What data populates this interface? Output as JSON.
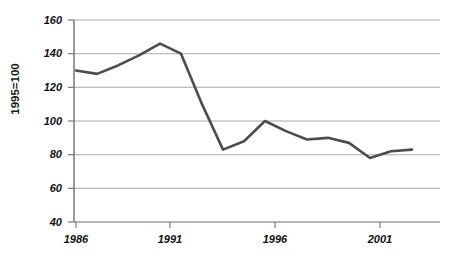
{
  "chart_data": {
    "type": "line",
    "title": "",
    "subtitle": "",
    "xlabel": "",
    "ylabel": "1995=100",
    "xlim": [
      1986,
      2002
    ],
    "ylim": [
      40,
      160
    ],
    "grid": true,
    "legend": false,
    "line_color": "#4d4d4d",
    "grid_color": "#a8a8a8",
    "axis_color": "#6e6e6e",
    "y_ticks": [
      160,
      140,
      120,
      100,
      80,
      60,
      40
    ],
    "x_ticks": [
      1986,
      1991,
      1996,
      2001
    ],
    "x_tick_labels": [
      "1986",
      "1991",
      "1996",
      "2001"
    ],
    "y_tick_labels": [
      "160",
      "140",
      "120",
      "100",
      "80",
      "60",
      "40"
    ],
    "x": [
      1986,
      1987,
      1988,
      1989,
      1990,
      1991,
      1992,
      1993,
      1994,
      1995,
      1996,
      1997,
      1998,
      1999,
      2000,
      2001,
      2002
    ],
    "series": [
      {
        "name": "Index (1995=100)",
        "values": [
          130,
          128,
          133,
          139,
          146,
          140,
          110,
          83,
          88,
          100,
          94,
          89,
          90,
          87,
          78,
          82,
          83
        ]
      }
    ]
  }
}
